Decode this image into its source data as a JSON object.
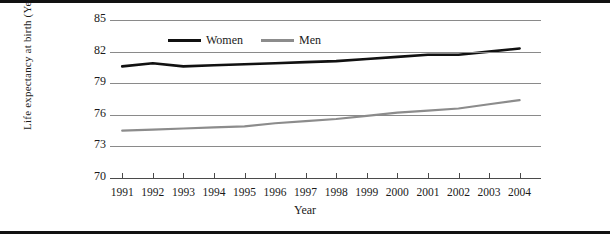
{
  "chart_data": {
    "type": "line",
    "title": "",
    "xlabel": "Year",
    "ylabel": "Life expectancy at birth (Years)",
    "categories": [
      1991,
      1992,
      1993,
      1994,
      1995,
      1996,
      1997,
      1998,
      1999,
      2000,
      2001,
      2002,
      2003,
      2004
    ],
    "xtick_labels": [
      "1991",
      "1992",
      "1993",
      "1994",
      "1995",
      "1996",
      "1997",
      "1998",
      "1999",
      "2000",
      "2001",
      "2002",
      "2003",
      "2004"
    ],
    "ytick_labels": [
      "70",
      "73",
      "76",
      "79",
      "82",
      "85"
    ],
    "yticks": [
      70,
      73,
      76,
      79,
      82,
      85
    ],
    "ylim": [
      70,
      85
    ],
    "xlim": [
      1990.6,
      2004.7
    ],
    "grid": true,
    "legend_position": "top-center",
    "series": [
      {
        "name": "Women",
        "color": "#111111",
        "values": [
          80.6,
          80.9,
          80.6,
          80.7,
          80.8,
          80.9,
          81.0,
          81.1,
          81.3,
          81.5,
          81.7,
          81.7,
          82.0,
          82.3
        ]
      },
      {
        "name": "Men",
        "color": "#8c8c8c",
        "values": [
          74.5,
          74.6,
          74.7,
          74.8,
          74.9,
          75.2,
          75.4,
          75.6,
          75.9,
          76.2,
          76.4,
          76.6,
          77.0,
          77.4
        ]
      }
    ]
  },
  "figure": {
    "y_axis_title": "Life expectancy at birth (Years)",
    "x_axis_title": "Year"
  },
  "legend": {
    "items": [
      {
        "label": "Women"
      },
      {
        "label": "Men"
      }
    ]
  }
}
